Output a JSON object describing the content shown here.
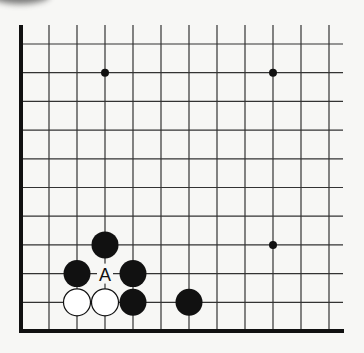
{
  "diagram": {
    "type": "go-board-corner",
    "corner": "bottom-left",
    "columns": 12,
    "rows": 11,
    "star_points": [
      [
        3,
        9
      ],
      [
        9,
        9
      ],
      [
        9,
        3
      ]
    ],
    "stones": [
      {
        "color": "black",
        "col": 3,
        "row": 3
      },
      {
        "color": "black",
        "col": 2,
        "row": 2
      },
      {
        "color": "black",
        "col": 4,
        "row": 2
      },
      {
        "color": "white",
        "col": 2,
        "row": 1
      },
      {
        "color": "white",
        "col": 3,
        "row": 1
      },
      {
        "color": "black",
        "col": 4,
        "row": 1
      },
      {
        "color": "black",
        "col": 6,
        "row": 1
      }
    ],
    "labels": [
      {
        "text": "A",
        "col": 3,
        "row": 2
      }
    ],
    "colors": {
      "line": "#333333",
      "black_stone": "#111111",
      "white_stone": "#ffffff",
      "background": "#f7f7f5"
    }
  }
}
